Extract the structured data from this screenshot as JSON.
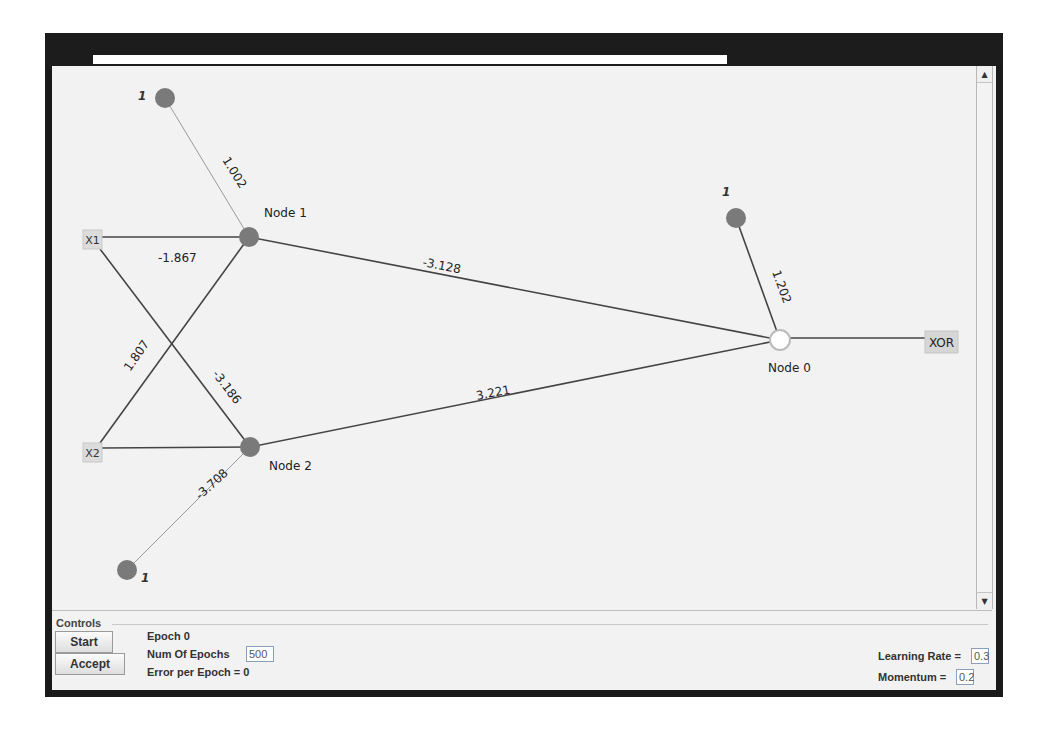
{
  "window": {
    "title": ""
  },
  "network": {
    "inputs": [
      {
        "id": "x1",
        "label": "X1",
        "x": 83,
        "y": 230,
        "w": 19,
        "h": 19
      },
      {
        "id": "x2",
        "label": "X2",
        "x": 83,
        "y": 443,
        "w": 19,
        "h": 19
      }
    ],
    "output": {
      "label": "XOR",
      "x": 925,
      "y": 331,
      "w": 33,
      "h": 22
    },
    "nodes": [
      {
        "id": "node1",
        "label": "Node 1",
        "cx": 249,
        "cy": 237,
        "fill": "#7a7a7a",
        "lx": 264,
        "ly": 217
      },
      {
        "id": "node2",
        "label": "Node 2",
        "cx": 250,
        "cy": 447,
        "fill": "#7a7a7a",
        "lx": 269,
        "ly": 470
      },
      {
        "id": "node0",
        "label": "Node 0",
        "cx": 780,
        "cy": 340,
        "fill": "#ffffff",
        "lx": 768,
        "ly": 372
      }
    ],
    "biases": [
      {
        "id": "bias1",
        "label": "1",
        "cx": 165,
        "cy": 98,
        "lx": 138,
        "ly": 100
      },
      {
        "id": "bias2",
        "label": "1",
        "cx": 127,
        "cy": 570,
        "lx": 141,
        "ly": 582
      },
      {
        "id": "bias0",
        "label": "1",
        "cx": 736,
        "cy": 218,
        "lx": 722,
        "ly": 196
      }
    ],
    "edges": [
      {
        "from": "bias1",
        "to": "node1",
        "x1": 165,
        "y1": 98,
        "x2": 249,
        "y2": 237,
        "weight": "1.002",
        "light": true,
        "wx": 222,
        "wy": 160,
        "angle": 58
      },
      {
        "from": "x1",
        "to": "node1",
        "x1": 102,
        "y1": 237,
        "x2": 249,
        "y2": 237,
        "weight": "-1.867",
        "light": false,
        "wx": 158,
        "wy": 262,
        "angle": 0
      },
      {
        "from": "x1",
        "to": "node2",
        "x1": 100,
        "y1": 249,
        "x2": 250,
        "y2": 447,
        "weight": "-3.186",
        "light": false,
        "wx": 212,
        "wy": 374,
        "angle": 53
      },
      {
        "from": "x2",
        "to": "node1",
        "x1": 100,
        "y1": 443,
        "x2": 249,
        "y2": 237,
        "weight": "1.807",
        "light": false,
        "wx": 130,
        "wy": 372,
        "angle": -55
      },
      {
        "from": "x2",
        "to": "node2",
        "x1": 102,
        "y1": 448,
        "x2": 250,
        "y2": 447,
        "weight": "",
        "light": false,
        "wx": 0,
        "wy": 0,
        "angle": 0
      },
      {
        "from": "bias2",
        "to": "node2",
        "x1": 127,
        "y1": 570,
        "x2": 250,
        "y2": 447,
        "weight": "-3.708",
        "light": true,
        "wx": 200,
        "wy": 500,
        "angle": -42
      },
      {
        "from": "node1",
        "to": "node0",
        "x1": 249,
        "y1": 237,
        "x2": 780,
        "y2": 340,
        "weight": "-3.128",
        "light": false,
        "wx": 422,
        "wy": 266,
        "angle": 11
      },
      {
        "from": "node2",
        "to": "node0",
        "x1": 250,
        "y1": 447,
        "x2": 780,
        "y2": 340,
        "weight": "3.221",
        "light": false,
        "wx": 477,
        "wy": 400,
        "angle": -11
      },
      {
        "from": "bias0",
        "to": "node0",
        "x1": 736,
        "y1": 218,
        "x2": 780,
        "y2": 340,
        "weight": "1.202",
        "light": false,
        "wx": 772,
        "wy": 272,
        "angle": 70
      },
      {
        "from": "node0",
        "to": "output",
        "x1": 790,
        "y1": 338,
        "x2": 925,
        "y2": 338,
        "weight": "",
        "light": false,
        "wx": 0,
        "wy": 0,
        "angle": 0
      }
    ]
  },
  "controls": {
    "group_title": "Controls",
    "start_label": "Start",
    "accept_label": "Accept",
    "epoch_label": "Epoch  0",
    "num_epochs_label": "Num Of Epochs",
    "num_epochs_value": "500",
    "error_label": "Error per Epoch = 0",
    "learning_rate_label": "Learning Rate =",
    "learning_rate_value": "0.3",
    "momentum_label": "Momentum =",
    "momentum_value": "0.2"
  },
  "scrollbar": {
    "up_icon": "▲",
    "down_icon": "▼"
  },
  "colors": {
    "node": "#7a7a7a",
    "edge": "#444444",
    "edge_light": "#9a9a9a",
    "background": "#f2f2f2",
    "frame": "#1a1a1a"
  }
}
